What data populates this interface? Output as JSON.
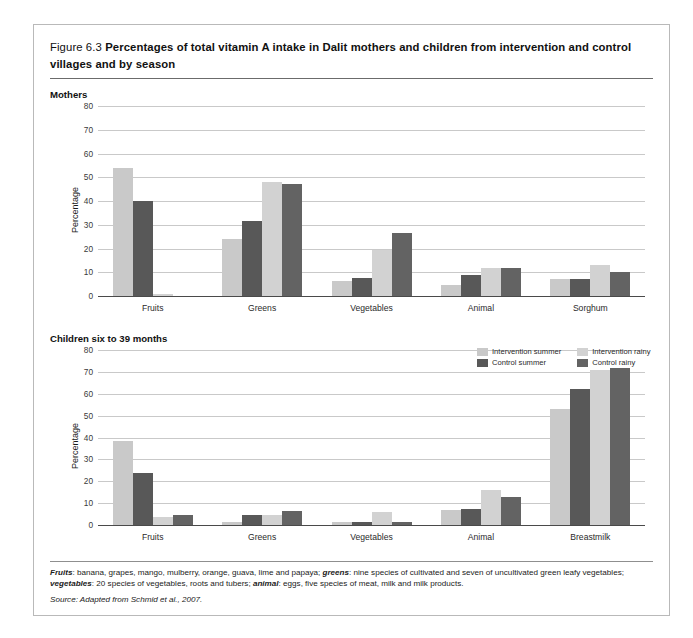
{
  "figure": {
    "number": "Figure 6.3",
    "title": "Percentages of total vitamin A intake in Dalit mothers and children from intervention and control villages and by season"
  },
  "panels": {
    "mothers_heading": "Mothers",
    "children_heading": "Children six to 39 months"
  },
  "legend": {
    "items": [
      {
        "label": "Intervention summer",
        "color": "#c9c9c9"
      },
      {
        "label": "Intervention rainy",
        "color": "#d2d2d2"
      },
      {
        "label": "Control summer",
        "color": "#585858"
      },
      {
        "label": "Control rainy",
        "color": "#636363"
      }
    ]
  },
  "footnotes": {
    "line1_a": "Fruits",
    "line1_b": ": banana, grapes, mango, mulberry, orange, guava, lime and papaya; ",
    "line1_c": "greens",
    "line1_d": ": nine species of cultivated and seven of uncultivated green leafy vegetables; ",
    "line1_e": "vegetables",
    "line1_f": ": 20 species of vegetables, roots and tubers; ",
    "line1_g": "animal",
    "line1_h": ": eggs, five species of meat, milk and milk products.",
    "source_label": "Source",
    "source_text": ": Adapted from Schmid et al., 2007."
  },
  "chart_data": [
    {
      "type": "bar",
      "title": "Mothers",
      "xlabel": "",
      "ylabel": "Percentage",
      "ylim": [
        0,
        80
      ],
      "yticks": [
        0,
        10,
        20,
        30,
        40,
        50,
        60,
        70,
        80
      ],
      "grid": true,
      "legend_position": "below-right",
      "categories": [
        "Fruits",
        "Greens",
        "Vegetables",
        "Animal",
        "Sorghum"
      ],
      "series": [
        {
          "name": "Intervention summer",
          "color": "#c9c9c9",
          "values": [
            54,
            24,
            6.5,
            4.5,
            7
          ]
        },
        {
          "name": "Control summer",
          "color": "#585858",
          "values": [
            40,
            31.5,
            7.5,
            9,
            7
          ]
        },
        {
          "name": "Intervention rainy",
          "color": "#d2d2d2",
          "values": [
            1,
            48,
            19.5,
            12,
            13
          ]
        },
        {
          "name": "Control rainy",
          "color": "#636363",
          "values": [
            0,
            47,
            26.5,
            12,
            10
          ]
        }
      ]
    },
    {
      "type": "bar",
      "title": "Children six to 39 months",
      "xlabel": "",
      "ylabel": "Percentage",
      "ylim": [
        0,
        80
      ],
      "yticks": [
        0,
        10,
        20,
        30,
        40,
        50,
        60,
        70,
        80
      ],
      "grid": true,
      "legend_position": "above-right",
      "categories": [
        "Fruits",
        "Greens",
        "Vegetables",
        "Animal",
        "Breastmilk"
      ],
      "series": [
        {
          "name": "Intervention summer",
          "color": "#c9c9c9",
          "values": [
            38.5,
            1.5,
            1.5,
            7,
            53
          ]
        },
        {
          "name": "Control summer",
          "color": "#585858",
          "values": [
            24,
            4.5,
            1.5,
            7.5,
            62
          ]
        },
        {
          "name": "Intervention rainy",
          "color": "#d2d2d2",
          "values": [
            3.5,
            4.5,
            6,
            16,
            71
          ]
        },
        {
          "name": "Control rainy",
          "color": "#636363",
          "values": [
            4.5,
            6.5,
            1.5,
            13,
            72
          ]
        }
      ]
    }
  ]
}
